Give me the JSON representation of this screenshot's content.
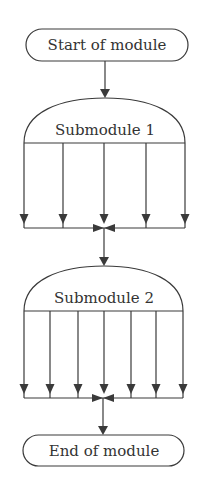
{
  "diagram": {
    "type": "flowchart",
    "start": {
      "label": "Start of module"
    },
    "submodules": [
      {
        "label": "Submodule 1",
        "branches": 5
      },
      {
        "label": "Submodule 2",
        "branches": 7
      }
    ],
    "end": {
      "label": "End of module"
    }
  },
  "colors": {
    "line": "#3a3a3a",
    "text": "#333333",
    "background": "#ffffff"
  }
}
